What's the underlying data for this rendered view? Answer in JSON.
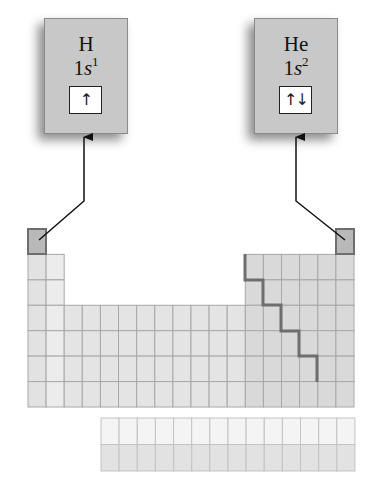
{
  "elements": [
    {
      "symbol": "H",
      "config_prefix": "1",
      "config_orbital": "s",
      "config_exp": "1",
      "orbital_arrows": "↑"
    },
    {
      "symbol": "He",
      "config_prefix": "1",
      "config_orbital": "s",
      "config_exp": "2",
      "orbital_arrows": "↑↓"
    }
  ],
  "colors": {
    "box_fill": "#c8c8c8",
    "highlight_cell": "#b9b9b9",
    "s_block_group1": "#e2e2e2",
    "s_block_group2": "#ececec",
    "d_block": "#e4e4e4",
    "p_block": "#d9d9d9",
    "f_row1": "#f4f4f4",
    "f_row2": "#e2e2e2",
    "grid_line": "#a8a8a8",
    "stair_line": "#707070"
  }
}
